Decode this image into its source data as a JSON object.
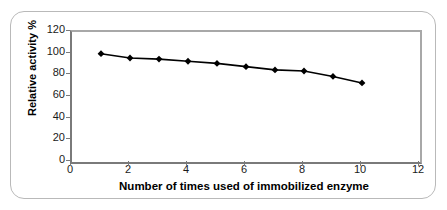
{
  "chart_data": {
    "type": "line",
    "title": "",
    "subtitle": "",
    "xlabel": "Number of times used of immobilized enzyme",
    "ylabel": "Relative activity %",
    "xlim": [
      0,
      12
    ],
    "ylim": [
      0,
      120
    ],
    "xticks": [
      0,
      2,
      4,
      6,
      8,
      10,
      12
    ],
    "yticks": [
      0,
      20,
      40,
      60,
      80,
      100,
      120
    ],
    "xtick_labels": [
      "0",
      "2",
      "4",
      "6",
      "8",
      "10",
      "12"
    ],
    "ytick_labels": [
      "0",
      "20",
      "40",
      "60",
      "80",
      "100",
      "120"
    ],
    "grid": false,
    "legend": false,
    "legend_position": "none",
    "marker": "diamond",
    "marker_color": "#000000",
    "line_color": "#000000",
    "x": [
      1,
      2,
      3,
      4,
      5,
      6,
      7,
      8,
      9,
      10
    ],
    "series": [
      {
        "name": "Relative activity %",
        "values": [
          100,
          96,
          95,
          93,
          91,
          88,
          85,
          84,
          79,
          73
        ]
      }
    ],
    "annotations": []
  },
  "figure": {
    "border_color": "#b9b9b9",
    "background": "#ffffff",
    "axis_color": "#7a7a7a"
  }
}
